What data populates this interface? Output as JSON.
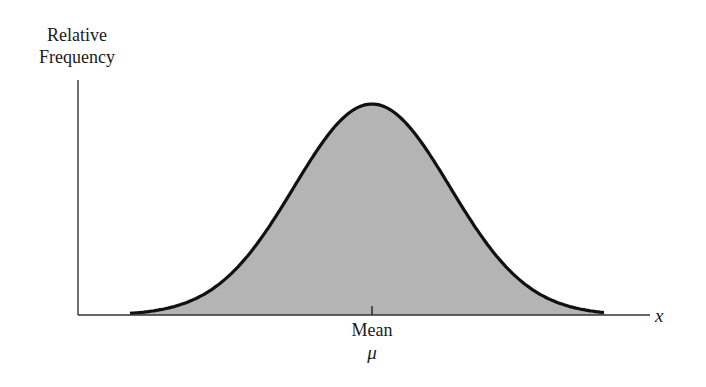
{
  "chart_data": {
    "type": "area",
    "title": "",
    "ylabel": "Relative Frequency",
    "ylabel_lines": [
      "Relative",
      "Frequency"
    ],
    "xlabel": "x",
    "annotations": [
      {
        "label": "Mean",
        "symbol": "μ",
        "position": "center tick on x-axis"
      }
    ],
    "series": [
      {
        "name": "normal density",
        "shape": "bell curve",
        "peak_at": "mean",
        "fill": "#b4b4b4",
        "stroke": "#111111"
      }
    ],
    "grid": false,
    "legend": null
  },
  "labels": {
    "y_axis_line1": "Relative",
    "y_axis_line2": "Frequency",
    "mean": "Mean",
    "mu": "μ",
    "x_axis": "x"
  },
  "colors": {
    "fill": "#b4b4b4",
    "curve": "#111111",
    "axis": "#333333"
  }
}
